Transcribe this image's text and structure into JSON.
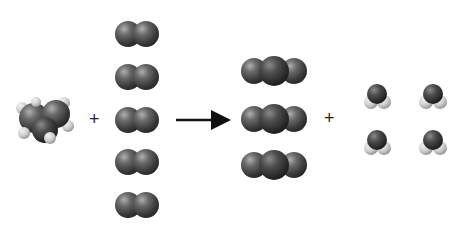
{
  "diagram": {
    "type": "chemical-reaction",
    "reactants": [
      {
        "name": "propane",
        "count": 1
      },
      {
        "name": "oxygen",
        "formula_shape": "O2",
        "count": 5
      }
    ],
    "products": [
      {
        "name": "carbon-dioxide",
        "formula_shape": "CO2",
        "count": 3
      },
      {
        "name": "water",
        "formula_shape": "H2O",
        "count": 4
      }
    ],
    "symbols": {
      "plus_1": "+",
      "plus_2": "+",
      "arrow": "reaction-arrow"
    },
    "colors": {
      "dark_atom": "#4a4a4a",
      "light_atom": "#d8d8d8",
      "arrow": "#111111"
    }
  }
}
